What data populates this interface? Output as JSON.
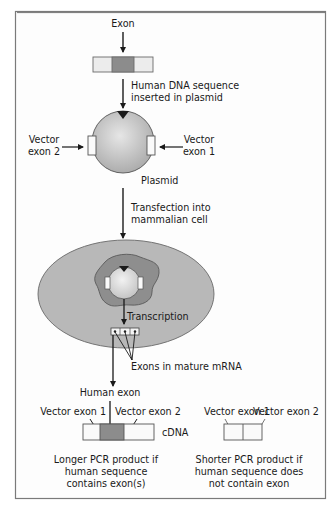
{
  "colors": {
    "frame_border": "#7a7a7a",
    "frame_bg": "#fdfdfd",
    "exon_dark": "#8c8c8c",
    "exon_light": "#ececec",
    "plasmid_fill": "#c4c4c4",
    "cell_fill": "#b8b8b8",
    "nucleus_fill": "#8e8e8e",
    "line": "#1a1a1a"
  },
  "labels": {
    "exon": "Exon",
    "step1_line1": "Human DNA sequence",
    "step1_line2": "inserted in plasmid",
    "vector_exon2_line1": "Vector",
    "vector_exon2_line2": "exon 2",
    "vector_exon1_line1": "Vector",
    "vector_exon1_line2": "exon 1",
    "plasmid": "Plasmid",
    "step2_line1": "Transfection into",
    "step2_line2": "mammalian cell",
    "transcription": "Transcription",
    "exons_mrna": "Exons in mature mRNA",
    "human_exon": "Human exon",
    "left_vector_exon1": "Vector exon 1",
    "left_vector_exon2": "Vector exon 2",
    "cdna": "cDNA",
    "right_vector_exon1": "Vector exon 1",
    "right_vector_exon2": "Vector exon 2",
    "longer_line1": "Longer PCR product if",
    "longer_line2": "human sequence",
    "longer_line3": "contains exon(s)",
    "shorter_line1": "Shorter PCR product if",
    "shorter_line2": "human sequence does",
    "shorter_line3": "not contain exon"
  }
}
